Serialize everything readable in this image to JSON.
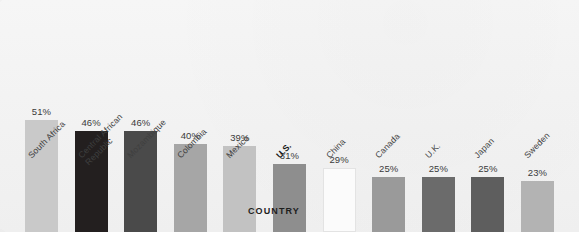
{
  "chart": {
    "xlabel": "COUNTRY",
    "value_suffix": "%"
  },
  "chart_data": {
    "type": "bar",
    "title": "",
    "xlabel": "COUNTRY",
    "ylabel": "",
    "ylim": [
      0,
      55
    ],
    "grid": false,
    "legend": "none",
    "categories": [
      "South Africa",
      "Central African Republic",
      "Mozambique",
      "Colombia",
      "Mexico",
      "U.S.",
      "China",
      "Canada",
      "U.K.",
      "Japan",
      "Sweden"
    ],
    "values": [
      51,
      46,
      46,
      40,
      39,
      31,
      29,
      25,
      25,
      25,
      23
    ],
    "value_labels": [
      "51%",
      "46%",
      "46%",
      "40%",
      "39%",
      "31%",
      "29%",
      "25%",
      "25%",
      "25%",
      "23%"
    ],
    "bar_colors": [
      "#c9c9c9",
      "#231f1f",
      "#4a4a4a",
      "#a6a6a6",
      "#c2c2c2",
      "#8e8e8e",
      "#fbfbfb",
      "#9a9a9a",
      "#6b6b6b",
      "#5e5e5e",
      "#b3b3b3"
    ],
    "highlighted_category": "U.S."
  },
  "labels": [
    {
      "line1": "South Africa",
      "line2": ""
    },
    {
      "line1": "Central African",
      "line2": "Republic"
    },
    {
      "line1": "Mozambique",
      "line2": ""
    },
    {
      "line1": "Colombia",
      "line2": ""
    },
    {
      "line1": "Mexico",
      "line2": ""
    },
    {
      "line1": "U.S.",
      "line2": ""
    },
    {
      "line1": "China",
      "line2": ""
    },
    {
      "line1": "Canada",
      "line2": ""
    },
    {
      "line1": "U.K.",
      "line2": ""
    },
    {
      "line1": "Japan",
      "line2": ""
    },
    {
      "line1": "Sweden",
      "line2": ""
    }
  ]
}
